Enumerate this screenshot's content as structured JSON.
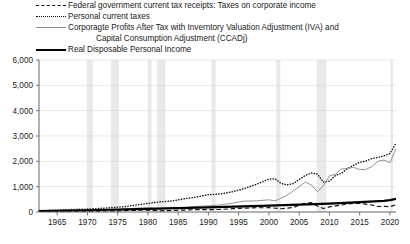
{
  "legend": {
    "position": "top-left",
    "entries": [
      {
        "style": "dashed",
        "color": "#111111",
        "label": "Federal government current tax receipts: Taxes on corporate income"
      },
      {
        "style": "dotted",
        "color": "#111111",
        "label": "Personal current taxes"
      },
      {
        "style": "solid-thin",
        "color": "#8c8c8c",
        "label": "Corporagte Profits After Tax with Inverntory Valuation Adjustment (IVA) and"
      },
      {
        "style": "none",
        "color": "#8c8c8c",
        "label": "Capital Consumption Adjustment (CCADj)"
      },
      {
        "style": "solid-thick",
        "color": "#000000",
        "label": "Real Disposable Personal Income"
      }
    ]
  },
  "chart_data": {
    "type": "line",
    "title": "",
    "xlabel": "",
    "ylabel": "",
    "xlim": [
      1962,
      2021
    ],
    "ylim": [
      0,
      6000
    ],
    "yticks": [
      "0",
      "1,000",
      "2,000",
      "3,000",
      "4,000",
      "5,000",
      "6,000"
    ],
    "ytick_values": [
      0,
      1000,
      2000,
      3000,
      4000,
      5000,
      6000
    ],
    "xticks": [
      "1965",
      "1970",
      "1975",
      "1980",
      "1985",
      "1990",
      "1995",
      "2000",
      "2005",
      "2010",
      "2015",
      "2020"
    ],
    "xtick_values": [
      1965,
      1970,
      1975,
      1980,
      1985,
      1990,
      1995,
      2000,
      2005,
      2010,
      2015,
      2020
    ],
    "grid": "horizontal",
    "recession_bands": [
      [
        1969.9,
        1970.9
      ],
      [
        1973.9,
        1975.2
      ],
      [
        1980.0,
        1980.6
      ],
      [
        1981.5,
        1982.9
      ],
      [
        1990.5,
        1991.2
      ],
      [
        2001.2,
        2001.9
      ],
      [
        2007.9,
        2009.5
      ],
      [
        2020.1,
        2020.5
      ]
    ],
    "recession_color": "#e9e9e9",
    "series": [
      {
        "name": "Federal government current tax receipts: Taxes on corporate income",
        "style": "dashed",
        "color": "#111111",
        "x": [
          1962,
          1964,
          1966,
          1968,
          1970,
          1972,
          1974,
          1976,
          1978,
          1980,
          1982,
          1984,
          1986,
          1988,
          1990,
          1992,
          1994,
          1996,
          1998,
          2000,
          2002,
          2004,
          2005,
          2006,
          2007,
          2008,
          2009,
          2010,
          2011,
          2012,
          2013,
          2014,
          2015,
          2016,
          2017,
          2018,
          2019,
          2020,
          2021
        ],
        "values": [
          22,
          27,
          33,
          36,
          33,
          36,
          42,
          53,
          67,
          70,
          50,
          62,
          76,
          97,
          94,
          100,
          131,
          155,
          166,
          170,
          130,
          175,
          270,
          340,
          370,
          240,
          140,
          200,
          240,
          275,
          315,
          340,
          345,
          310,
          275,
          215,
          225,
          210,
          290
        ]
      },
      {
        "name": "Personal current taxes",
        "style": "dotted",
        "color": "#111111",
        "x": [
          1962,
          1965,
          1968,
          1970,
          1972,
          1974,
          1976,
          1978,
          1980,
          1982,
          1984,
          1986,
          1988,
          1990,
          1992,
          1994,
          1996,
          1998,
          2000,
          2001,
          2002,
          2003,
          2004,
          2005,
          2006,
          2007,
          2008,
          2009,
          2010,
          2011,
          2012,
          2013,
          2014,
          2015,
          2016,
          2017,
          2018,
          2019,
          2020,
          2021
        ],
        "values": [
          58,
          70,
          105,
          115,
          140,
          175,
          205,
          270,
          340,
          400,
          435,
          520,
          590,
          680,
          710,
          800,
          930,
          1100,
          1300,
          1310,
          1130,
          1070,
          1120,
          1280,
          1440,
          1540,
          1500,
          1180,
          1220,
          1440,
          1530,
          1720,
          1840,
          1960,
          2010,
          2110,
          2150,
          2220,
          2310,
          2720
        ]
      },
      {
        "name": "Corporagte Profits After Tax with Inverntory Valuation Adjustment (IVA) and Capital Consumption Adjustment (CCADj)",
        "style": "solid-thin",
        "color": "#8c8c8c",
        "x": [
          1962,
          1965,
          1968,
          1970,
          1972,
          1974,
          1976,
          1978,
          1980,
          1982,
          1984,
          1986,
          1988,
          1990,
          1992,
          1994,
          1996,
          1998,
          2000,
          2001,
          2002,
          2003,
          2004,
          2005,
          2006,
          2007,
          2008,
          2009,
          2010,
          2011,
          2012,
          2013,
          2014,
          2015,
          2016,
          2017,
          2018,
          2019,
          2020,
          2021
        ],
        "values": [
          45,
          65,
          68,
          58,
          80,
          85,
          115,
          150,
          165,
          140,
          185,
          175,
          220,
          245,
          280,
          350,
          430,
          440,
          480,
          440,
          540,
          660,
          830,
          1000,
          1180,
          1070,
          800,
          1030,
          1420,
          1500,
          1700,
          1720,
          1760,
          1680,
          1680,
          1790,
          2000,
          2050,
          1950,
          2500
        ]
      },
      {
        "name": "Real Disposable Personal Income",
        "style": "solid-thick",
        "color": "#000000",
        "x": [
          1962,
          1970,
          1980,
          1990,
          2000,
          2005,
          2010,
          2015,
          2019,
          2020,
          2021
        ],
        "values": [
          40,
          70,
          120,
          180,
          250,
          290,
          330,
          390,
          440,
          470,
          520
        ]
      }
    ],
    "note_series_scaling": "Dotted and gray series plotted against left axis in billions; gray series rises to ~5,800 peak near 2019 then dips"
  }
}
